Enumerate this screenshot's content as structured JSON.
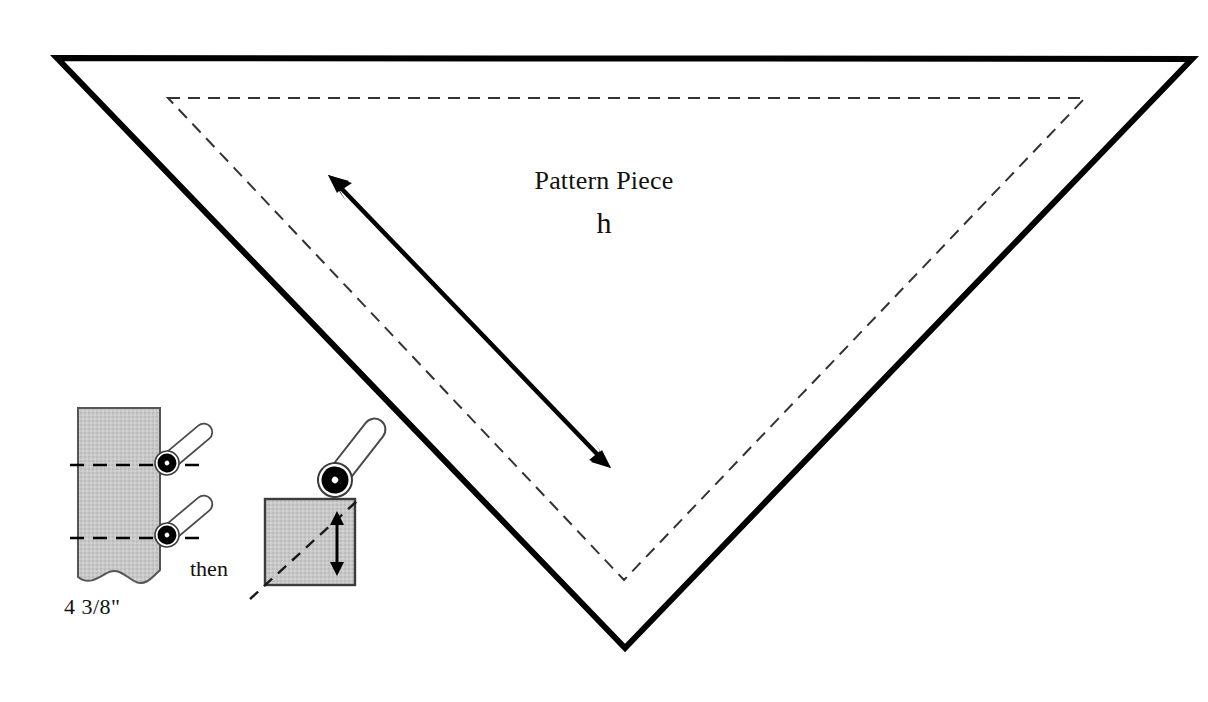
{
  "document": {
    "type": "sewing-pattern-diagram",
    "background_color": "#ffffff"
  },
  "pattern": {
    "title": "Pattern Piece",
    "piece_id": "h",
    "cut_line_color": "#000000",
    "seam_line_color": "#333333",
    "grainline_color": "#000000",
    "shape": "inverted-triangle",
    "cut_line": {
      "points": "57,58 1192,59 625,648",
      "stroke_width": 6
    },
    "seam_line": {
      "points": "168,98 1085,98 624,580",
      "stroke_width": 2,
      "dash": "12 8"
    },
    "grainline": {
      "from_x": 330,
      "from_y": 177,
      "to_x": 609,
      "to_y": 466,
      "stroke_width": 4,
      "double_headed": true
    }
  },
  "detail": {
    "fabric_color": "#c8c8c8",
    "fabric_edge_color": "#4a4a4a",
    "fold_line_color": "#000000",
    "measurement": "4 3/8\"",
    "step_connector": "then",
    "strip": {
      "x": 78,
      "y": 408,
      "width": 82,
      "height": 172,
      "fold_lines_y": [
        465,
        538
      ]
    },
    "square": {
      "x": 265,
      "y": 499,
      "width": 90,
      "height": 86
    },
    "pins": [
      {
        "name": "pin-upper-left",
        "head_x": 167,
        "head_y": 463,
        "head_r": 12,
        "angle": -40,
        "length": 44
      },
      {
        "name": "pin-lower-left",
        "head_x": 167,
        "head_y": 535,
        "head_r": 12,
        "angle": -40,
        "length": 44
      },
      {
        "name": "pin-square",
        "head_x": 335,
        "head_y": 480,
        "head_r": 17,
        "angle": -55,
        "length": 62
      }
    ],
    "height_arrow": {
      "x": 337,
      "top_y": 515,
      "bottom_y": 572,
      "stroke_width": 3,
      "double_headed": true
    },
    "diagonal_fold": {
      "from_x": 252,
      "from_y": 597,
      "to_x": 352,
      "to_y": 506
    }
  }
}
